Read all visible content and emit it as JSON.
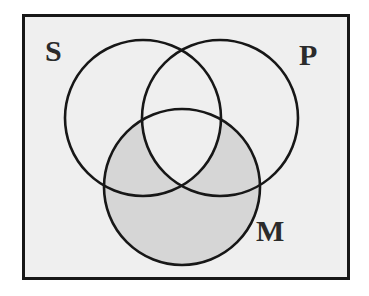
{
  "figure": {
    "kind": "venn-diagram",
    "type": "three-circle-syllogism-venn",
    "background_color": "#efefef",
    "page_color": "#ffffff",
    "border_color": "#171717",
    "stroke_color": "#171717",
    "shade_color": "#d6d6d6",
    "circle_fill": "#efefef",
    "labels": {
      "subject": "S",
      "predicate": "P",
      "middle": "M"
    },
    "circles": [
      {
        "id": "S",
        "label": "S",
        "cx": 143,
        "cy": 118,
        "r": 78
      },
      {
        "id": "P",
        "label": "P",
        "cx": 220,
        "cy": 118,
        "r": 78
      },
      {
        "id": "M",
        "label": "M",
        "cx": 182,
        "cy": 187,
        "r": 78
      }
    ],
    "shaded_region": {
      "description": "M minus the S-and-P overlap",
      "formula": "M − (S ∩ P)",
      "color": "#d6d6d6"
    },
    "frame": {
      "x": 22,
      "y": 14,
      "width": 328,
      "height": 266,
      "stroke_width": 3
    }
  },
  "chart_data": {
    "type": "venn",
    "title": "",
    "sets": [
      "S",
      "P",
      "M"
    ],
    "circles": [
      {
        "set": "S",
        "cx": 143,
        "cy": 118,
        "r": 78,
        "label": "S",
        "label_x": 52,
        "label_y": 52
      },
      {
        "set": "P",
        "cx": 220,
        "cy": 118,
        "r": 78,
        "label": "P",
        "label_x": 308,
        "label_y": 56
      },
      {
        "set": "M",
        "cx": 182,
        "cy": 187,
        "r": 78,
        "label": "M",
        "label_x": 271,
        "label_y": 234
      }
    ],
    "regions": [
      {
        "id": "S-only",
        "members": [
          "S"
        ],
        "shaded": false
      },
      {
        "id": "P-only",
        "members": [
          "P"
        ],
        "shaded": false
      },
      {
        "id": "M-only",
        "members": [
          "M"
        ],
        "shaded": true
      },
      {
        "id": "S-and-P",
        "members": [
          "S",
          "P"
        ],
        "shaded": false
      },
      {
        "id": "S-and-M",
        "members": [
          "S",
          "M"
        ],
        "shaded": true
      },
      {
        "id": "P-and-M",
        "members": [
          "P",
          "M"
        ],
        "shaded": true
      },
      {
        "id": "S-and-P-and-M",
        "members": [
          "S",
          "P",
          "M"
        ],
        "shaded": false
      },
      {
        "id": "outside",
        "members": [],
        "shaded": false
      }
    ],
    "shaded_expression": "M − (S ∩ P)",
    "legend": [],
    "grid": false
  }
}
